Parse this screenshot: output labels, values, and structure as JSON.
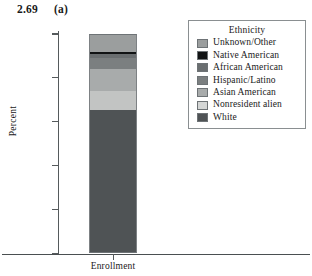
{
  "figure": {
    "number": "2.69",
    "panel": "(a)"
  },
  "chart_data": {
    "type": "bar",
    "title": "",
    "subtitle": "",
    "stacked": true,
    "categories": [
      "Enrollment"
    ],
    "xlabel": "Enrollment",
    "ylabel": "Percent",
    "ylim": [
      0,
      100
    ],
    "yticks": [
      0,
      20,
      40,
      60,
      80,
      100
    ],
    "ytick_labels": [
      "0",
      "20",
      "40",
      "60",
      "80",
      "100"
    ],
    "grid": false,
    "legend_title": "Ethnicity",
    "legend_position": "right",
    "series": [
      {
        "name": "White",
        "values": [
          65.5
        ],
        "color": "#4f5355",
        "cumulative_top": 65.5
      },
      {
        "name": "Nonresident alien",
        "values": [
          8.5
        ],
        "color": "#c2c4c3",
        "cumulative_top": 74.0
      },
      {
        "name": "Asian American",
        "values": [
          10.0
        ],
        "color": "#a8abab",
        "cumulative_top": 84.0
      },
      {
        "name": "Hispanic/Latino",
        "values": [
          5.0
        ],
        "color": "#7b7f80",
        "cumulative_top": 89.0
      },
      {
        "name": "African American",
        "values": [
          2.0
        ],
        "color": "#6a6e70",
        "cumulative_top": 91.0
      },
      {
        "name": "Native American",
        "values": [
          1.0
        ],
        "color": "#111314",
        "cumulative_top": 92.0
      },
      {
        "name": "Unknown/Other",
        "values": [
          8.0
        ],
        "color": "#9b9e9e",
        "cumulative_top": 100.0
      }
    ],
    "legend_entries": [
      {
        "label": "Unknown/Other",
        "color": "#9b9e9e"
      },
      {
        "label": "Native American",
        "color": "#111314"
      },
      {
        "label": "African American",
        "color": "#6a6e70"
      },
      {
        "label": "Hispanic/Latino",
        "color": "#7b7f80"
      },
      {
        "label": "Asian American",
        "color": "#a8abab"
      },
      {
        "label": "Nonresident alien",
        "color": "#d4d6d5"
      },
      {
        "label": "White",
        "color": "#4f5355"
      }
    ]
  },
  "colors": {
    "axis": "#555a5c",
    "legend_border": "#8a8f91",
    "background": "#ffffff"
  }
}
